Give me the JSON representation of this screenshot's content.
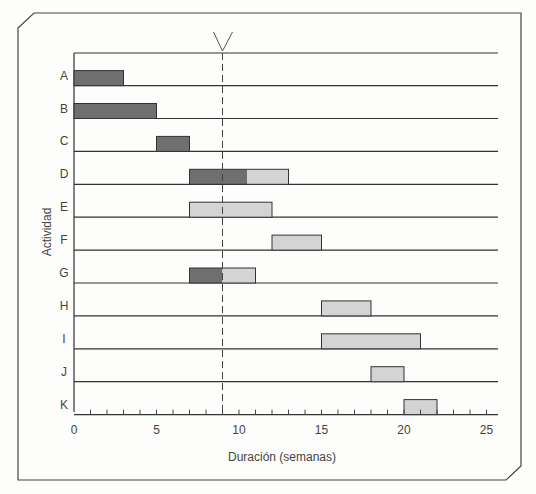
{
  "chart_data": {
    "type": "gantt",
    "title": "",
    "xlabel": "Duración (semanas)",
    "ylabel": "Actividad",
    "xlim": [
      0,
      25
    ],
    "xticks": [
      0,
      5,
      10,
      15,
      20,
      25
    ],
    "minor_tick_step": 1,
    "current_time_marker": 9,
    "colors": {
      "completed": "#6f6f6f",
      "remaining": "#d4d4d4",
      "line": "#333333"
    },
    "categories": [
      "A",
      "B",
      "C",
      "D",
      "E",
      "F",
      "G",
      "H",
      "I",
      "J",
      "K"
    ],
    "tasks": [
      {
        "name": "A",
        "start": 0,
        "end": 3,
        "completed_until": 3
      },
      {
        "name": "B",
        "start": 0,
        "end": 5,
        "completed_until": 5
      },
      {
        "name": "C",
        "start": 5,
        "end": 7,
        "completed_until": 7
      },
      {
        "name": "D",
        "start": 7,
        "end": 13,
        "completed_until": 10.5
      },
      {
        "name": "E",
        "start": 7,
        "end": 12,
        "completed_until": 7
      },
      {
        "name": "F",
        "start": 12,
        "end": 15,
        "completed_until": 12
      },
      {
        "name": "G",
        "start": 7,
        "end": 11,
        "completed_until": 9
      },
      {
        "name": "H",
        "start": 15,
        "end": 18,
        "completed_until": 15
      },
      {
        "name": "I",
        "start": 15,
        "end": 21,
        "completed_until": 15
      },
      {
        "name": "J",
        "start": 18,
        "end": 20,
        "completed_until": 18
      },
      {
        "name": "K",
        "start": 20,
        "end": 22,
        "completed_until": 20
      }
    ]
  }
}
